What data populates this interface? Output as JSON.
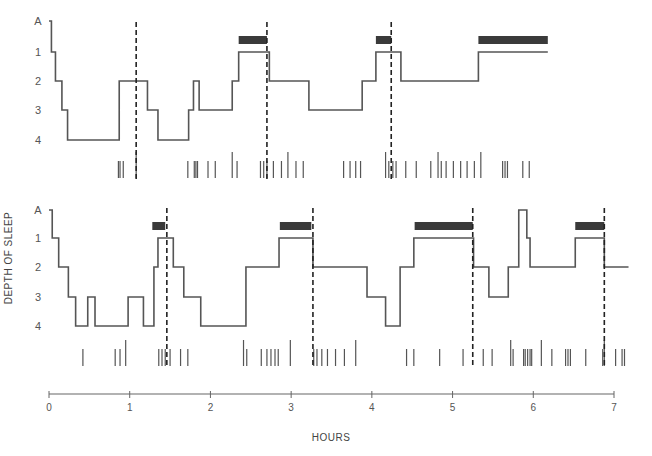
{
  "chart_data": {
    "type": "line",
    "subtype": "hypnogram-step",
    "title": "",
    "xlabel": "HOURS",
    "ylabel": "DEPTH OF SLEEP",
    "xlim": [
      0,
      7
    ],
    "x_ticks": [
      "0",
      "1",
      "2",
      "3",
      "4",
      "5",
      "6",
      "7"
    ],
    "y_ticks": [
      "A",
      "1",
      "2",
      "3",
      "4"
    ],
    "y_levels": {
      "A": 0,
      "1": 1,
      "2": 2,
      "3": 3,
      "4": 4
    },
    "grid": false,
    "legend": null,
    "panels": [
      {
        "name": "night-1",
        "steps": [
          [
            0.0,
            0
          ],
          [
            0.03,
            1
          ],
          [
            0.08,
            2
          ],
          [
            0.16,
            3
          ],
          [
            0.23,
            4
          ],
          [
            0.87,
            2
          ],
          [
            1.22,
            3
          ],
          [
            1.35,
            4
          ],
          [
            1.73,
            3
          ],
          [
            1.79,
            2
          ],
          [
            1.86,
            3
          ],
          [
            2.27,
            2
          ],
          [
            2.35,
            1
          ],
          [
            2.73,
            2
          ],
          [
            3.22,
            3
          ],
          [
            3.88,
            2
          ],
          [
            4.05,
            1
          ],
          [
            4.36,
            2
          ],
          [
            5.32,
            1
          ],
          [
            6.18,
            1
          ]
        ],
        "rem_bars": [
          [
            2.35,
            2.7
          ],
          [
            4.05,
            4.24
          ],
          [
            5.32,
            6.18
          ]
        ],
        "dashed_markers": [
          1.08,
          2.7,
          4.24
        ],
        "event_ticks": [
          0.86,
          0.88,
          0.92,
          1.08,
          1.72,
          1.8,
          1.82,
          1.84,
          1.97,
          2.06,
          2.27,
          2.33,
          2.62,
          2.66,
          2.7,
          2.78,
          2.88,
          2.96,
          3.06,
          3.15,
          3.65,
          3.73,
          3.8,
          3.86,
          4.17,
          4.21,
          4.26,
          4.3,
          4.42,
          4.55,
          4.73,
          4.82,
          4.86,
          4.92,
          5.01,
          5.1,
          5.18,
          5.27,
          5.35,
          5.62,
          5.65,
          5.68,
          5.87,
          5.95
        ]
      },
      {
        "name": "night-2",
        "steps": [
          [
            0.0,
            0
          ],
          [
            0.04,
            1
          ],
          [
            0.12,
            2
          ],
          [
            0.24,
            3
          ],
          [
            0.33,
            4
          ],
          [
            0.48,
            3
          ],
          [
            0.57,
            4
          ],
          [
            0.98,
            3
          ],
          [
            1.17,
            4
          ],
          [
            1.3,
            2
          ],
          [
            1.35,
            1
          ],
          [
            1.54,
            2
          ],
          [
            1.67,
            3
          ],
          [
            1.88,
            4
          ],
          [
            2.44,
            2
          ],
          [
            2.85,
            1
          ],
          [
            3.27,
            2
          ],
          [
            3.94,
            3
          ],
          [
            4.17,
            4
          ],
          [
            4.35,
            2
          ],
          [
            4.52,
            1
          ],
          [
            5.26,
            2
          ],
          [
            5.45,
            3
          ],
          [
            5.69,
            2
          ],
          [
            5.82,
            0
          ],
          [
            5.92,
            1
          ],
          [
            5.96,
            2
          ],
          [
            6.52,
            1
          ],
          [
            6.88,
            2
          ],
          [
            7.18,
            2
          ]
        ],
        "rem_bars": [
          [
            1.28,
            1.44
          ],
          [
            2.86,
            3.25
          ],
          [
            4.53,
            5.25
          ],
          [
            6.52,
            6.88
          ]
        ],
        "dashed_markers": [
          1.46,
          3.27,
          5.25,
          6.88
        ],
        "event_ticks": [
          0.42,
          0.82,
          0.88,
          0.95,
          1.36,
          1.4,
          1.44,
          1.5,
          1.63,
          1.72,
          2.41,
          2.45,
          2.63,
          2.7,
          2.75,
          2.8,
          2.84,
          2.99,
          3.28,
          3.32,
          3.38,
          3.45,
          3.55,
          3.66,
          3.8,
          4.43,
          4.52,
          4.84,
          5.13,
          5.38,
          5.49,
          5.72,
          5.75,
          5.88,
          5.9,
          5.93,
          5.96,
          5.98,
          6.1,
          6.23,
          6.4,
          6.43,
          6.46,
          6.65,
          6.86,
          6.88,
          7.02,
          7.1,
          7.13
        ]
      }
    ]
  },
  "labels": {
    "ylabel": "DEPTH OF SLEEP",
    "xlabel": "HOURS",
    "y_ticks": [
      "A",
      "1",
      "2",
      "3",
      "4"
    ],
    "x_ticks": [
      "0",
      "1",
      "2",
      "3",
      "4",
      "5",
      "6",
      "7"
    ]
  },
  "colors": {
    "line": "#555555",
    "rem_bar": "#3a3a3a",
    "dashed": "#222222",
    "axis": "#666666"
  }
}
